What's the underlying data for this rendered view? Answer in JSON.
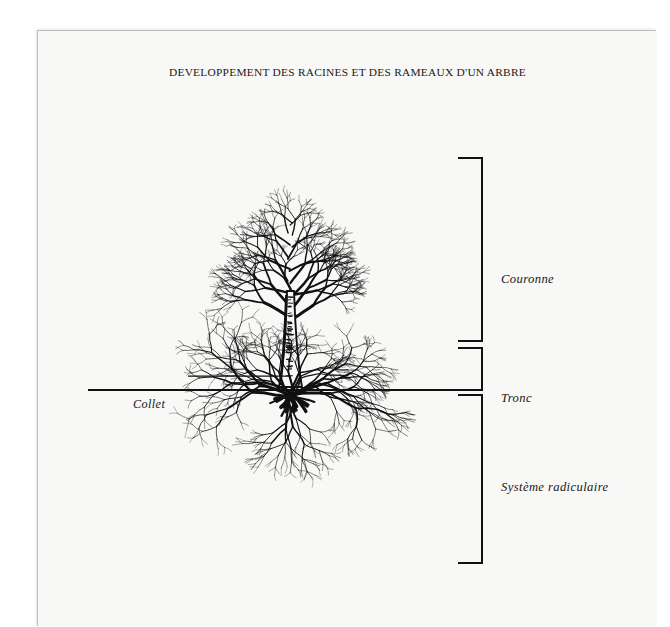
{
  "document": {
    "title": "DEVELOPPEMENT DES RACINES ET DES RAMEAUX D'UN ARBRE",
    "paper_color": "#f8f8f6",
    "ink_color": "#111111",
    "background_color": "#ffffff"
  },
  "figure": {
    "type": "botanical-diagram",
    "ground_line": {
      "label": "soil-surface-line",
      "x_start": 50,
      "x_end": 427,
      "y": 359
    },
    "callout": {
      "label": "Collet",
      "leader_from_x": 150,
      "leader_to_x": 252,
      "leader_y": 345
    },
    "brackets": [
      {
        "label": "Couronne",
        "y_top": 127,
        "y_bottom": 310,
        "spine_x": 444,
        "arm_x": 420
      },
      {
        "label": "Tronc",
        "y_top": 317,
        "y_bottom": 359,
        "spine_x": 444,
        "arm_x": 420
      },
      {
        "label": "Système radiculaire",
        "y_top": 364,
        "y_bottom": 532,
        "spine_x": 444,
        "arm_x": 420
      }
    ],
    "parts": [
      {
        "name": "crown",
        "label": "Couronne",
        "description": "bare branching canopy"
      },
      {
        "name": "trunk",
        "label": "Tronc",
        "description": "vertical textured stem"
      },
      {
        "name": "roots",
        "label": "Système radiculaire",
        "description": "spreading fibrous root system"
      },
      {
        "name": "collar",
        "label": "Collet",
        "description": "root collar at soil line"
      }
    ]
  }
}
